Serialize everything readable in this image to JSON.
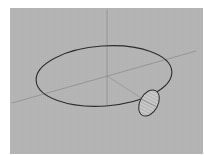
{
  "figure": {
    "background_color": "#ffffff",
    "panel_color": "#b5b5b5",
    "panel": {
      "x": 10,
      "y": 8,
      "width": 193,
      "height": 146
    }
  },
  "chart_data": {
    "type": "diagram",
    "title": "",
    "xlabel": "",
    "ylabel": "",
    "projection": "oblique-3d",
    "stroke_color": "#2b2b2b",
    "axis_color": "#8c8c8c",
    "elements": [
      {
        "name": "main-ellipse",
        "kind": "ellipse",
        "role": "large tilted disk outline",
        "center_x": 104,
        "center_y": 76,
        "radius_x": 68,
        "radius_y": 30,
        "rotation_deg": -4,
        "fill": "none",
        "stroke": "#2b2b2b",
        "stroke_width": 1.1
      },
      {
        "name": "small-ellipse",
        "kind": "ellipse",
        "role": "small shaded inclined ellipse on rim",
        "center_x": 149,
        "center_y": 103,
        "radius_x": 9,
        "radius_y": 14,
        "rotation_deg": 28,
        "fill": "#c9c9c9",
        "stroke": "#2b2b2b",
        "stroke_width": 1.0,
        "hatched": true,
        "hatch_color": "#9a9a9a",
        "hatch_angle_deg": 118
      },
      {
        "name": "vertical-axis",
        "kind": "line",
        "role": "vertical coordinate axis through center",
        "x1": 107,
        "y1": 10,
        "x2": 107,
        "y2": 105,
        "stroke": "#8c8c8c",
        "stroke_width": 0.9
      },
      {
        "name": "diagonal-axis",
        "kind": "line",
        "role": "oblique coordinate axis lower-left to upper-right",
        "x1": 12,
        "y1": 103,
        "x2": 196,
        "y2": 51,
        "stroke": "#8c8c8c",
        "stroke_width": 0.9
      },
      {
        "name": "radius-segment",
        "kind": "line",
        "role": "short radius from center to small ellipse",
        "x1": 107,
        "y1": 76,
        "x2": 149,
        "y2": 103,
        "stroke": "#8c8c8c",
        "stroke_width": 0.8
      }
    ],
    "labels": [],
    "legend": [],
    "grid": false
  }
}
